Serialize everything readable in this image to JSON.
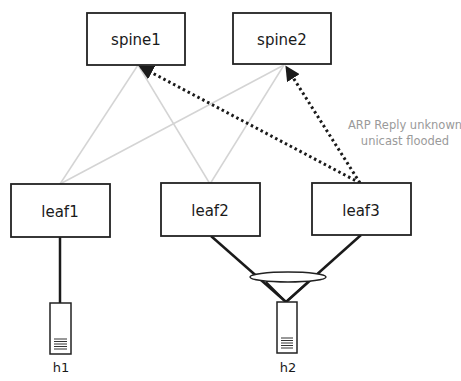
{
  "diagram": {
    "spines": [
      {
        "id": "spine1",
        "label": "spine1"
      },
      {
        "id": "spine2",
        "label": "spine2"
      }
    ],
    "leaves": [
      {
        "id": "leaf1",
        "label": "leaf1"
      },
      {
        "id": "leaf2",
        "label": "leaf2"
      },
      {
        "id": "leaf3",
        "label": "leaf3"
      }
    ],
    "hosts": [
      {
        "id": "h1",
        "label": "h1",
        "attached_to": [
          "leaf1"
        ]
      },
      {
        "id": "h2",
        "label": "h2",
        "attached_to": [
          "leaf2",
          "leaf3"
        ],
        "bonded": true
      }
    ],
    "links": {
      "fabric": [
        {
          "from": "spine1",
          "to": "leaf1",
          "style": "light-gray"
        },
        {
          "from": "spine1",
          "to": "leaf2",
          "style": "light-gray"
        },
        {
          "from": "spine2",
          "to": "leaf1",
          "style": "light-gray"
        },
        {
          "from": "spine2",
          "to": "leaf2",
          "style": "light-gray"
        }
      ],
      "flood": [
        {
          "from": "leaf3",
          "to": "spine1",
          "style": "dotted-arrow"
        },
        {
          "from": "leaf3",
          "to": "spine2",
          "style": "dotted-arrow"
        }
      ],
      "access": [
        {
          "from": "leaf1",
          "to": "h1"
        },
        {
          "from": "leaf2",
          "to": "h2"
        },
        {
          "from": "leaf3",
          "to": "h2"
        }
      ]
    },
    "annotation": {
      "line1": "ARP Reply unknown",
      "line2": "unicast flooded"
    },
    "colors": {
      "box_stroke": "#222222",
      "fabric_link": "#d4d4d4",
      "flood_link": "#1a1a1a",
      "annotation_text": "#9a9a9a"
    }
  }
}
